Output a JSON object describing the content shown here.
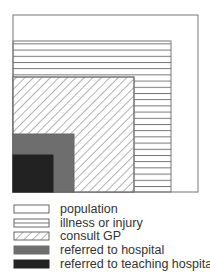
{
  "diagram": {
    "type": "nested-area",
    "colors": {
      "stroke": "#666666",
      "hatch": "#555555",
      "referred_hospital": "#6e6e6e",
      "teaching_hospital": "#222222"
    },
    "boxes": [
      {
        "id": "population",
        "x": 13,
        "y": 15,
        "w": 185,
        "h": 177,
        "fill": "white"
      },
      {
        "id": "illness",
        "x": 13,
        "y": 41,
        "w": 158,
        "h": 151,
        "fill": "horizontal-lines"
      },
      {
        "id": "consult",
        "x": 13,
        "y": 77,
        "w": 121,
        "h": 115,
        "fill": "diagonal-hatch"
      },
      {
        "id": "hospital",
        "x": 13,
        "y": 134,
        "w": 61,
        "h": 58,
        "fill": "gray"
      },
      {
        "id": "teaching",
        "x": 13,
        "y": 155,
        "w": 40,
        "h": 37,
        "fill": "dark"
      }
    ]
  },
  "legend": {
    "items": [
      {
        "label": "population",
        "swatch": "white"
      },
      {
        "label": "illness or injury",
        "swatch": "horizontal-lines"
      },
      {
        "label": "consult GP",
        "swatch": "diagonal-hatch"
      },
      {
        "label": "referred to hospital",
        "swatch": "gray"
      },
      {
        "label": "referred to teaching hospital",
        "swatch": "dark"
      }
    ]
  }
}
